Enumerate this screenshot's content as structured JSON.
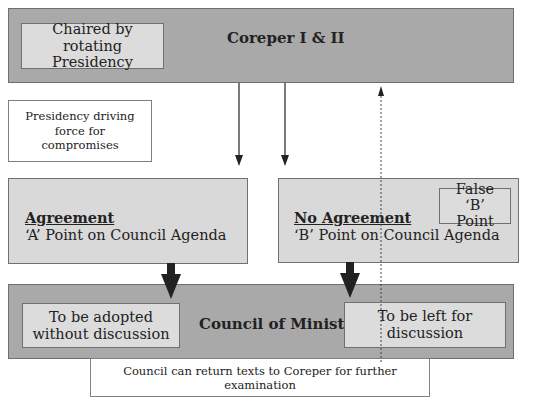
{
  "coreper": {
    "title": "Coreper I & II",
    "chair_note": "Chaired by rotating Presidency"
  },
  "presidency_note": "Presidency driving force for compromises",
  "agreement": {
    "heading": "Agreement",
    "text": "‘A’ Point on Council Agenda"
  },
  "no_agreement": {
    "heading": "No Agreement",
    "text": "‘B’ Point on Council Agenda",
    "false_b_point": "False ‘B’ Point"
  },
  "council": {
    "title": "Council of Ministers",
    "left_note": "To be adopted without discussion",
    "right_note": "To be left for discussion"
  },
  "return_note": "Council can return texts to Coreper for further examination",
  "colors": {
    "bar_fill": "#a9a9a9",
    "panel_fill": "#d9d9d9",
    "inner_box_fill": "#dcdcdc",
    "arrow": "#222222"
  }
}
